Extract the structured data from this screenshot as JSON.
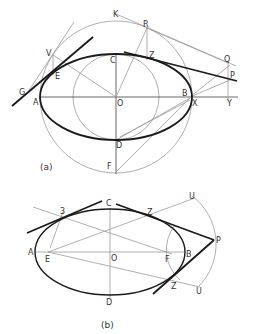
{
  "figure_a": {
    "caption": "(a)",
    "labels": {
      "K": "K",
      "R": "R",
      "V": "V",
      "Z": "Z",
      "C": "C",
      "Q": "Q",
      "P": "P",
      "E": "E",
      "G": "G",
      "A": "A",
      "O": "O",
      "B": "B",
      "X": "X",
      "Y": "Y",
      "D": "D",
      "F": "F"
    }
  },
  "figure_b": {
    "caption": "(b)",
    "labels": {
      "C": "C",
      "Z1": "Z",
      "U1": "U",
      "three": "3",
      "P": "P",
      "A": "A",
      "E": "E",
      "O": "O",
      "F": "F",
      "B": "B",
      "Z2": "Z",
      "U2": "U",
      "D": "D"
    }
  },
  "colors": {
    "construction": "#9a9a9a",
    "curve": "#1a1a1a",
    "text": "#333333"
  }
}
